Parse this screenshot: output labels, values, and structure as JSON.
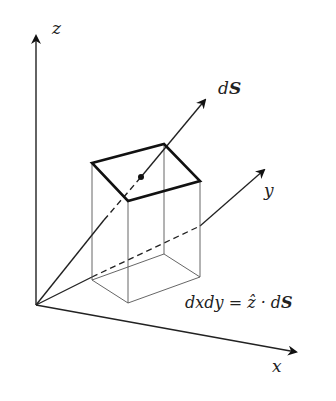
{
  "diagram": {
    "type": "3d-surface-element",
    "axes": {
      "z_label": "z",
      "y_label": "y",
      "x_label": "x"
    },
    "vector_label_d": "d",
    "vector_label_S": "S",
    "equation": {
      "lhs": "dxdy = ",
      "zhat": "ẑ",
      "dot": " · d",
      "S": "S"
    },
    "colors": {
      "stroke": "#222222",
      "box": "#555555",
      "background": "#ffffff"
    }
  }
}
